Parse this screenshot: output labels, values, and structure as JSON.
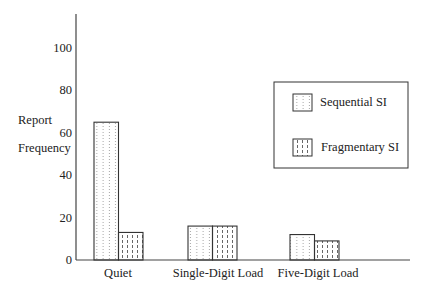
{
  "chart_data": {
    "type": "bar",
    "title": "",
    "xlabel": "",
    "ylabel": "Report Frequency",
    "ylabel_lines": [
      "Report",
      "Frequency"
    ],
    "ylim": [
      0,
      110
    ],
    "yticks": [
      0,
      20,
      40,
      60,
      80,
      100
    ],
    "grid": false,
    "legend_position": "upper right",
    "categories": [
      "Quiet",
      "Single-Digit Load",
      "Five-Digit Load"
    ],
    "series": [
      {
        "name": "Sequential SI",
        "pattern": "dotted-vertical",
        "values": [
          65,
          16,
          12
        ]
      },
      {
        "name": "Fragmentary SI",
        "pattern": "dashed-vertical",
        "values": [
          13,
          16,
          9
        ]
      }
    ]
  },
  "axis": {
    "tick_labels": [
      "0",
      "20",
      "40",
      "60",
      "80",
      "100"
    ]
  },
  "legend": {
    "items": [
      "Sequential SI",
      "Fragmentary SI"
    ]
  },
  "colors": {
    "axis": "#444444",
    "bar_edge": "#333333",
    "pattern_sequential": "#9a9a9a",
    "pattern_fragmentary": "#555555"
  }
}
